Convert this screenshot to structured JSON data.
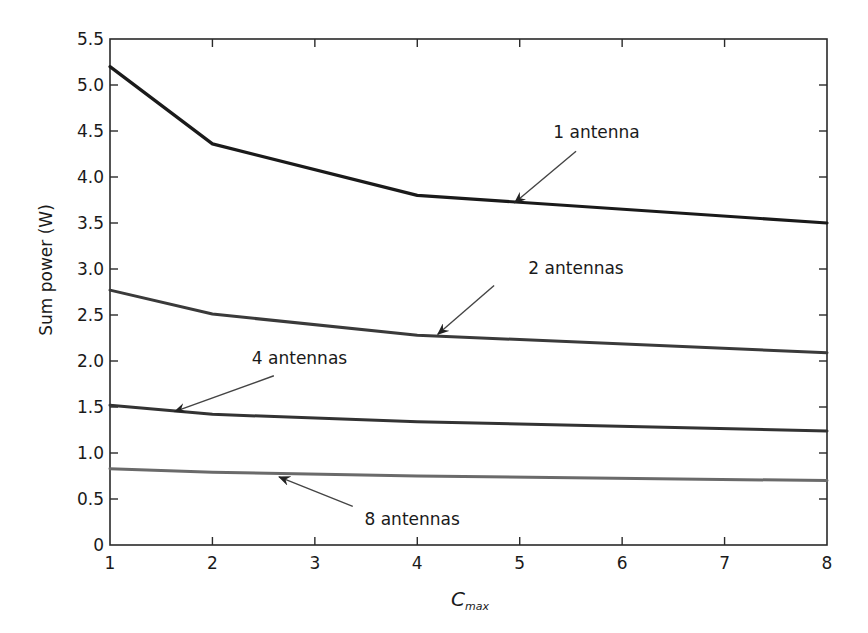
{
  "chart_data": {
    "type": "line",
    "title": "",
    "xlabel": "C_max",
    "xlabel_main": "C",
    "xlabel_sub": "max",
    "ylabel": "Sum power (W)",
    "xlim": [
      1,
      8
    ],
    "ylim": [
      0,
      5.5
    ],
    "grid": false,
    "legend": "none (inline arrow annotations)",
    "x_ticks": [
      1,
      2,
      3,
      4,
      5,
      6,
      7,
      8
    ],
    "x_tick_labels": [
      "1",
      "2",
      "3",
      "4",
      "5",
      "6",
      "7",
      "8"
    ],
    "y_ticks": [
      0,
      0.5,
      1.0,
      1.5,
      2.0,
      2.5,
      3.0,
      3.5,
      4.0,
      4.5,
      5.0,
      5.5
    ],
    "y_tick_labels": [
      "0",
      "0.5",
      "1.0",
      "1.5",
      "2.0",
      "2.5",
      "3.0",
      "3.5",
      "4.0",
      "4.5",
      "5.0",
      "5.5"
    ],
    "x": [
      1,
      2,
      4,
      8
    ],
    "series": [
      {
        "name": "1 antenna",
        "values": [
          5.2,
          4.36,
          3.8,
          3.5
        ],
        "color": "#1a1a1a",
        "width": 3.2
      },
      {
        "name": "2 antennas",
        "values": [
          2.77,
          2.51,
          2.28,
          2.09
        ],
        "color": "#3a3a3a",
        "width": 3.0
      },
      {
        "name": "4 antennas",
        "values": [
          1.52,
          1.42,
          1.34,
          1.24
        ],
        "color": "#333333",
        "width": 3.0
      },
      {
        "name": "8 antennas",
        "values": [
          0.83,
          0.79,
          0.75,
          0.7
        ],
        "color": "#6a6a6a",
        "width": 3.0
      }
    ],
    "annotations": [
      {
        "text": "1 antenna",
        "text_pos": [
          5.75,
          4.42
        ],
        "arrow_from": [
          5.55,
          4.28
        ],
        "arrow_to": [
          4.95,
          3.72
        ]
      },
      {
        "text": "2 antennas",
        "text_pos": [
          5.55,
          2.95
        ],
        "arrow_from": [
          4.75,
          2.82
        ],
        "arrow_to": [
          4.2,
          2.29
        ]
      },
      {
        "text": "4 antennas",
        "text_pos": [
          2.85,
          1.97
        ],
        "arrow_from": [
          2.6,
          1.84
        ],
        "arrow_to": [
          1.63,
          1.45
        ]
      },
      {
        "text": "8 antennas",
        "text_pos": [
          3.95,
          0.22
        ],
        "arrow_from": [
          3.37,
          0.42
        ],
        "arrow_to": [
          2.65,
          0.74
        ]
      }
    ]
  }
}
